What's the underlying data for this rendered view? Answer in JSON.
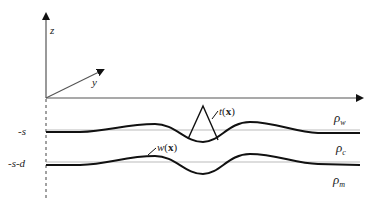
{
  "diagram": {
    "axes": {
      "z_label": "z",
      "y_label": "y"
    },
    "levels": {
      "upper": "-s",
      "lower": "-s-d"
    },
    "annotations": {
      "t_func": "t",
      "w_func": "w",
      "arg": "x",
      "open_paren": "(",
      "close_paren": ")"
    },
    "densities": {
      "water": {
        "symbol": "ρ",
        "sub": "w"
      },
      "crust": {
        "symbol": "ρ",
        "sub": "c"
      },
      "mantle": {
        "symbol": "ρ",
        "sub": "m"
      }
    },
    "colors": {
      "line": "#111111",
      "reference": "#999999"
    }
  }
}
